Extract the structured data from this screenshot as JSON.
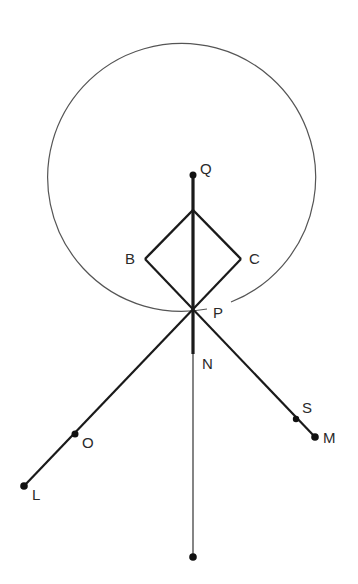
{
  "diagram": {
    "title": "",
    "colors": {
      "stroke": "#1a1a1a",
      "circle": "#555555",
      "label": "#2a2a2a",
      "background": "#ffffff"
    },
    "circle": {
      "center": "Q",
      "cx": 193,
      "cy": 175,
      "r": 134,
      "gap_near": "P"
    },
    "points": {
      "Q": {
        "label": "Q",
        "x": 193,
        "y": 175,
        "dot": true
      },
      "top": {
        "label": "",
        "x": 193,
        "y": 210,
        "dot": false
      },
      "B": {
        "label": "B",
        "x": 145,
        "y": 259,
        "dot": false
      },
      "C": {
        "label": "C",
        "x": 241,
        "y": 259,
        "dot": false
      },
      "P": {
        "label": "P",
        "x": 193,
        "y": 310,
        "dot": false
      },
      "N": {
        "label": "N",
        "x": 193,
        "y": 354,
        "dot": false
      },
      "O": {
        "label": "O",
        "x": 75,
        "y": 434,
        "dot": true
      },
      "L": {
        "label": "L",
        "x": 24,
        "y": 486,
        "dot": true
      },
      "S": {
        "label": "S",
        "x": 296,
        "y": 419,
        "dot": true
      },
      "M": {
        "label": "M",
        "x": 315,
        "y": 437,
        "dot": true
      },
      "bottom": {
        "label": "",
        "x": 193,
        "y": 557,
        "dot": true
      }
    },
    "segments": [
      {
        "from": "Q",
        "to": "N",
        "weight": "thick"
      },
      {
        "from": "N",
        "to": "bottom",
        "weight": "thin"
      },
      {
        "from": "top",
        "to": "B",
        "weight": "thick"
      },
      {
        "from": "top",
        "to": "C",
        "weight": "thick"
      },
      {
        "from": "B",
        "to": "M",
        "weight": "medium"
      },
      {
        "from": "C",
        "to": "L",
        "weight": "medium"
      }
    ],
    "labels": {
      "Q": "Q",
      "B": "B",
      "C": "C",
      "P": "P",
      "N": "N",
      "O": "O",
      "L": "L",
      "S": "S",
      "M": "M"
    }
  }
}
